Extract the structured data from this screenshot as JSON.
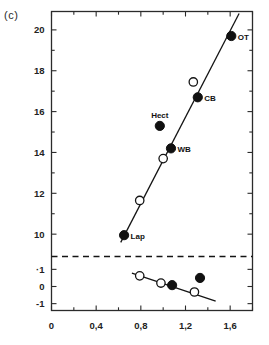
{
  "panel": {
    "label": "(c)"
  },
  "chart_data": {
    "type": "scatter",
    "title": "",
    "xlabel": "",
    "ylabel": "",
    "xlim": [
      0,
      1.8
    ],
    "ylim_upper": [
      9.2,
      20.9
    ],
    "ylim_lower": [
      -1.4,
      1.4
    ],
    "grid": false,
    "legend": "none",
    "axis_break": {
      "present": true,
      "style": "dashed",
      "note": "horizontal dashed line separating upper and lower y-axis segments"
    },
    "xticks": [
      {
        "value": 0,
        "label": "0"
      },
      {
        "value": 0.2,
        "label": ""
      },
      {
        "value": 0.4,
        "label": "0,4"
      },
      {
        "value": 0.6,
        "label": ""
      },
      {
        "value": 0.8,
        "label": "0,8"
      },
      {
        "value": 1.0,
        "label": ""
      },
      {
        "value": 1.2,
        "label": "1,2"
      },
      {
        "value": 1.4,
        "label": ""
      },
      {
        "value": 1.6,
        "label": "1,6"
      },
      {
        "value": 1.8,
        "label": ""
      }
    ],
    "yticks_upper": [
      {
        "value": 20,
        "label": "20"
      },
      {
        "value": 19,
        "label": ""
      },
      {
        "value": 18,
        "label": "18"
      },
      {
        "value": 17,
        "label": ""
      },
      {
        "value": 16,
        "label": "16"
      },
      {
        "value": 15,
        "label": ""
      },
      {
        "value": 14,
        "label": "14"
      },
      {
        "value": 13,
        "label": ""
      },
      {
        "value": 12,
        "label": "12"
      },
      {
        "value": 11,
        "label": ""
      },
      {
        "value": 10,
        "label": "10"
      }
    ],
    "yticks_lower": [
      {
        "value": 1,
        "label": "·1"
      },
      {
        "value": 0,
        "label": "0"
      },
      {
        "value": -1,
        "label": "-1"
      }
    ],
    "series": [
      {
        "name": "upper-filled",
        "marker": "filled-circle",
        "segment": "upper",
        "points": [
          {
            "x": 0.65,
            "y": 9.95,
            "label": "Lap",
            "label_pos": "right"
          },
          {
            "x": 1.07,
            "y": 14.2,
            "label": "WB",
            "label_pos": "right"
          },
          {
            "x": 0.97,
            "y": 15.3,
            "label": "Hect",
            "label_pos": "above"
          },
          {
            "x": 1.31,
            "y": 16.7,
            "label": "CB",
            "label_pos": "right"
          },
          {
            "x": 1.61,
            "y": 19.7,
            "label": "OT",
            "label_pos": "right"
          }
        ]
      },
      {
        "name": "upper-open",
        "marker": "open-circle",
        "segment": "upper",
        "points": [
          {
            "x": 0.79,
            "y": 11.65,
            "label": ""
          },
          {
            "x": 1.0,
            "y": 13.7,
            "label": ""
          },
          {
            "x": 1.27,
            "y": 17.45,
            "label": ""
          }
        ]
      },
      {
        "name": "lower-open",
        "marker": "open-circle",
        "segment": "lower",
        "points": [
          {
            "x": 0.79,
            "y": 0.62,
            "label": ""
          },
          {
            "x": 0.98,
            "y": 0.2,
            "label": ""
          },
          {
            "x": 1.28,
            "y": -0.32,
            "label": ""
          }
        ]
      },
      {
        "name": "lower-filled",
        "marker": "filled-circle",
        "segment": "lower",
        "points": [
          {
            "x": 1.08,
            "y": 0.08,
            "label": ""
          },
          {
            "x": 1.33,
            "y": 0.5,
            "label": ""
          }
        ]
      }
    ],
    "trend_lines": [
      {
        "name": "upper-regression",
        "segment": "upper",
        "x0": 0.62,
        "y0": 9.6,
        "x1": 1.68,
        "y1": 20.8
      },
      {
        "name": "lower-regression",
        "segment": "lower",
        "x0": 0.72,
        "y0": 0.78,
        "x1": 1.47,
        "y1": -0.85
      }
    ],
    "point_labels": [
      "Lap",
      "Hect",
      "WB",
      "CB",
      "OT"
    ]
  }
}
